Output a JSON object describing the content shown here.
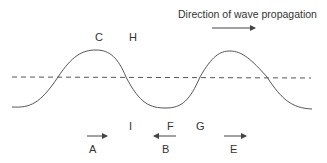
{
  "diagram": {
    "title": "Direction of wave propagation",
    "colors": {
      "line": "#555555",
      "text": "#333333",
      "background": "#ffffff"
    },
    "wave": {
      "type": "sinusoid",
      "crests": 2,
      "troughs": 1,
      "equilibrium_line": "dashed"
    },
    "labels": {
      "C": "C",
      "H": "H",
      "I": "I",
      "F": "F",
      "G": "G",
      "A": "A",
      "B": "B",
      "E": "E"
    },
    "arrows": [
      {
        "label": "A",
        "direction": "right"
      },
      {
        "label": "B",
        "direction": "left"
      },
      {
        "label": "E",
        "direction": "right"
      },
      {
        "label": "propagation",
        "direction": "right"
      }
    ]
  }
}
